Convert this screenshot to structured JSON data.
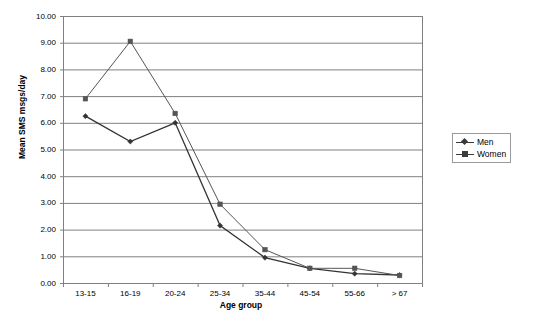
{
  "chart_data": {
    "type": "line",
    "title": "",
    "xlabel": "Age group",
    "ylabel": "Mean SMS msgs/day",
    "categories": [
      "13-15",
      "16-19",
      "20-24",
      "25-34",
      "35-44",
      "45-54",
      "55-66",
      "> 67"
    ],
    "series": [
      {
        "name": "Men",
        "marker": "diamond",
        "color": "#333333",
        "values": [
          6.25,
          5.3,
          6.0,
          2.15,
          0.95,
          0.55,
          0.35,
          0.3
        ]
      },
      {
        "name": "Women",
        "marker": "square",
        "color": "#555555",
        "values": [
          6.9,
          9.05,
          6.35,
          2.95,
          1.25,
          0.55,
          0.55,
          0.28
        ]
      }
    ],
    "ylim": [
      0.0,
      10.0
    ],
    "ytick_labels": [
      "10.00",
      "9.00",
      "8.00",
      "7.00",
      "6.00",
      "5.00",
      "4.00",
      "3.00",
      "2.00",
      "1.00",
      "0.00"
    ],
    "ytick_values": [
      10,
      9,
      8,
      7,
      6,
      5,
      4,
      3,
      2,
      1,
      0
    ],
    "grid": "horizontal",
    "legend_position": "right-middle",
    "legend_entries": [
      "Men",
      "Women"
    ],
    "plot_bgcolor": "#ffffff",
    "grid_color": "#808080",
    "axis_color": "#808080"
  },
  "axes": {
    "y_title": "Mean SMS msgs/day",
    "x_title": "Age group"
  }
}
